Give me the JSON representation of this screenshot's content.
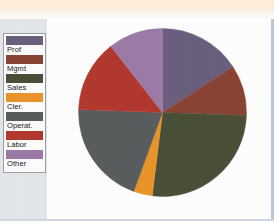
{
  "figure": {
    "background_color": "#fdfdfd",
    "gutter_color": "#e3e6e9",
    "paper_band_color": "#fdecd8"
  },
  "legend": {
    "border_color": "#9aa0a6",
    "background_color": "#fbfbfb",
    "items": [
      {
        "label": "Prof",
        "color": "#6b5f7e"
      },
      {
        "label": "Mgmt",
        "color": "#8a4436"
      },
      {
        "label": "Sales",
        "color": "#4a4f38"
      },
      {
        "label": "Cler.",
        "color": "#e8942a"
      },
      {
        "label": "Operat.",
        "color": "#595d5e"
      },
      {
        "label": "Labor",
        "color": "#b2392f"
      },
      {
        "label": "Other",
        "color": "#9b7aa6"
      }
    ]
  },
  "chart_data": {
    "type": "pie",
    "title": "",
    "subtitle": "",
    "xlabel": "",
    "ylabel": "",
    "legend_position": "left",
    "grid": false,
    "start_angle_deg": 0,
    "direction": "clockwise",
    "categories": [
      "Prof",
      "Mgmt",
      "Sales",
      "Cler.",
      "Operat.",
      "Labor",
      "Other"
    ],
    "values": [
      16,
      10,
      26,
      4,
      20,
      14,
      10
    ],
    "units": "percent",
    "colors": [
      "#6b5f7e",
      "#8a4436",
      "#4a4f38",
      "#e8942a",
      "#595d5e",
      "#b2392f",
      "#9b7aa6"
    ],
    "slices": [
      {
        "label": "Prof",
        "value": 16,
        "color": "#6b5f7e",
        "start_deg": 0,
        "end_deg": 57
      },
      {
        "label": "Mgmt",
        "value": 10,
        "color": "#8a4436",
        "start_deg": 57,
        "end_deg": 92
      },
      {
        "label": "Sales",
        "value": 26,
        "color": "#4a4f38",
        "start_deg": 92,
        "end_deg": 187
      },
      {
        "label": "Cler.",
        "value": 4,
        "color": "#e8942a",
        "start_deg": 187,
        "end_deg": 200
      },
      {
        "label": "Operat.",
        "value": 20,
        "color": "#595d5e",
        "start_deg": 200,
        "end_deg": 272
      },
      {
        "label": "Labor",
        "value": 14,
        "color": "#b2392f",
        "start_deg": 272,
        "end_deg": 322
      },
      {
        "label": "Other",
        "value": 10,
        "color": "#9b7aa6",
        "start_deg": 322,
        "end_deg": 360
      }
    ]
  }
}
